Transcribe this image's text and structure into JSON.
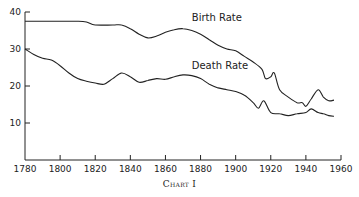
{
  "caption": "Chart I",
  "chart_data": {
    "type": "line",
    "title": "",
    "caption": "Chart I",
    "xlabel": "",
    "ylabel": "",
    "xlim": [
      1780,
      1960
    ],
    "ylim": [
      0,
      40
    ],
    "xticks": [
      1780,
      1800,
      1820,
      1840,
      1860,
      1880,
      1900,
      1920,
      1940,
      1960
    ],
    "yticks": [
      10,
      20,
      30,
      40
    ],
    "grid": false,
    "legend": "inline labels",
    "series": [
      {
        "name": "Birth Rate",
        "label_at": [
          1875,
          37.5
        ],
        "x": [
          1780,
          1790,
          1800,
          1810,
          1815,
          1820,
          1830,
          1835,
          1840,
          1845,
          1850,
          1855,
          1860,
          1865,
          1870,
          1875,
          1880,
          1885,
          1890,
          1895,
          1900,
          1905,
          1910,
          1915,
          1917,
          1920,
          1922,
          1925,
          1930,
          1935,
          1938,
          1940,
          1943,
          1947,
          1950,
          1953,
          1956
        ],
        "values": [
          37.5,
          37.5,
          37.5,
          37.5,
          37.3,
          36.5,
          36.5,
          36.5,
          35.5,
          34.0,
          33.0,
          33.5,
          34.5,
          35.2,
          35.5,
          35.0,
          34.0,
          32.5,
          31.0,
          30.0,
          29.5,
          28.0,
          26.5,
          24.5,
          22.0,
          22.5,
          23.5,
          19.0,
          17.0,
          15.5,
          15.5,
          14.5,
          16.5,
          19.0,
          17.0,
          16.0,
          16.2
        ]
      },
      {
        "name": "Death Rate",
        "label_at": [
          1875,
          24.5
        ],
        "x": [
          1780,
          1785,
          1790,
          1795,
          1800,
          1805,
          1810,
          1815,
          1820,
          1825,
          1830,
          1835,
          1840,
          1845,
          1850,
          1855,
          1860,
          1865,
          1870,
          1875,
          1880,
          1885,
          1890,
          1895,
          1900,
          1905,
          1910,
          1913,
          1916,
          1920,
          1925,
          1930,
          1935,
          1940,
          1943,
          1947,
          1950,
          1953,
          1956
        ],
        "values": [
          30.0,
          28.5,
          27.5,
          27.0,
          25.5,
          23.5,
          22.0,
          21.3,
          20.8,
          20.5,
          22.0,
          23.5,
          22.5,
          21.0,
          21.5,
          22.0,
          21.8,
          22.5,
          23.0,
          22.8,
          22.0,
          20.5,
          19.5,
          19.0,
          18.5,
          17.5,
          15.5,
          14.0,
          16.0,
          12.8,
          12.5,
          12.0,
          12.5,
          12.8,
          13.8,
          12.8,
          12.5,
          12.0,
          11.8
        ]
      }
    ]
  }
}
